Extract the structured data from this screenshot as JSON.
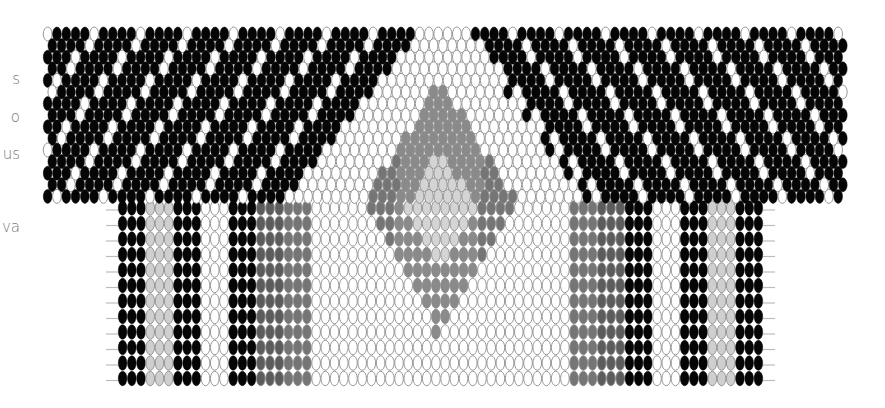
{
  "side_text": {
    "fragments": [
      {
        "text": "s",
        "top": 70
      },
      {
        "text": "o",
        "top": 108
      },
      {
        "text": "us",
        "top": 145
      },
      {
        "text": "va",
        "top": 218
      }
    ]
  },
  "pattern": {
    "title": "bead-pattern",
    "colors": {
      "black": "#050505",
      "white": "#ffffff",
      "light_grey": "#cfcfcf",
      "dark_grey": "#5c5c5c",
      "mid_grey": "#757575",
      "diamond_grey": "#8a8a8a",
      "diamond_light": "#d4d4d4",
      "outline": "#8c8c8c",
      "thread": "#bcbcbc"
    },
    "top_band": {
      "x": 43,
      "y": 27,
      "width": 802,
      "height": 173,
      "bead_w": 9.3,
      "row_h": 11.6,
      "rows": 15,
      "stripe_period": 5
    },
    "lower_band": {
      "x": 118,
      "y": 200,
      "width": 645,
      "height": 190,
      "bead_w": 9.4,
      "row_h": 15.5,
      "rows": 12,
      "columns": [
        {
          "color": "black",
          "count": 3
        },
        {
          "color": "light_grey",
          "count": 3
        },
        {
          "color": "black",
          "count": 3
        },
        {
          "color": "white",
          "count": 3
        },
        {
          "color": "black",
          "count": 3
        },
        {
          "color": "dark_grey",
          "count": 3
        },
        {
          "color": "mid_grey",
          "count": 3
        },
        {
          "color": "white",
          "count": 28
        },
        {
          "color": "mid_grey",
          "count": 3
        },
        {
          "color": "dark_grey",
          "count": 3
        },
        {
          "color": "black",
          "count": 3
        },
        {
          "color": "white",
          "count": 3
        },
        {
          "color": "black",
          "count": 3
        },
        {
          "color": "light_grey",
          "count": 3
        },
        {
          "color": "black",
          "count": 3
        }
      ]
    },
    "center": {
      "cx": 440,
      "apex_y": 27,
      "diamond_top": 80,
      "diamond_mid": 200,
      "diamond_bottom": 340,
      "diamond_half_width": 75,
      "inner_top": 150,
      "inner_mid": 205,
      "inner_bottom": 265,
      "inner_half_width": 35
    }
  }
}
